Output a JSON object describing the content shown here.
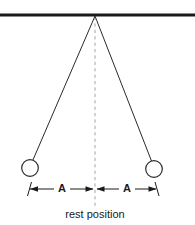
{
  "figure": {
    "type": "pendulum-amplitude-diagram",
    "background_color": "#ffffff",
    "ink_color": "#1a1a1a",
    "dashed_line_color": "#a8a8a8"
  },
  "labels": {
    "amplitude_left": "A",
    "amplitude_right": "A",
    "caption": "rest position"
  },
  "geometry": {
    "ceiling": {
      "x1": 0,
      "y1": 15,
      "x2": 195,
      "y2": 15,
      "thickness": 3
    },
    "pivot": {
      "x": 95,
      "y": 15
    },
    "rest_line": {
      "x": 95,
      "y_top": 16,
      "y_bottom": 206
    },
    "left_string": {
      "x1": 95,
      "y1": 16,
      "x2": 32,
      "y2": 161
    },
    "right_string": {
      "x1": 95,
      "y1": 16,
      "x2": 152,
      "y2": 161
    },
    "left_bob": {
      "cx": 30,
      "cy": 168,
      "r": 8.5
    },
    "right_bob": {
      "cx": 154,
      "cy": 169,
      "r": 8.5
    },
    "dimension_y": 189,
    "left_arrow": {
      "x_start": 30,
      "x_end": 93
    },
    "right_arrow": {
      "x_start": 97,
      "x_end": 156
    },
    "label_left_pos": {
      "x": 62,
      "y": 189
    },
    "label_right_pos": {
      "x": 127,
      "y": 189
    },
    "caption_pos": {
      "x": 95,
      "y": 215
    }
  }
}
